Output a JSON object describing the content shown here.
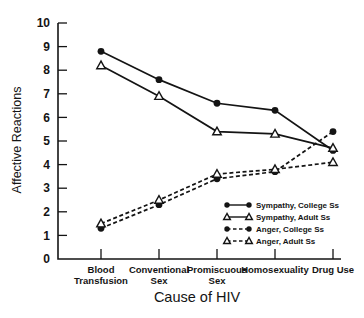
{
  "chart_data": {
    "type": "line",
    "title": "",
    "xlabel": "Cause of HIV",
    "ylabel": "Affective Reactions",
    "ylim": [
      0,
      10
    ],
    "y_ticks": [
      0,
      1,
      2,
      3,
      4,
      5,
      6,
      7,
      8,
      9,
      10
    ],
    "grid": false,
    "legend_position": "inside-bottom-right",
    "categories": [
      "Blood Transfusion",
      "Conventional Sex",
      "Promiscuous Sex",
      "Homosexuality",
      "Drug Use"
    ],
    "category_label_lines": [
      [
        "Blood",
        "Transfusion"
      ],
      [
        "Conventional",
        "Sex"
      ],
      [
        "Promiscuous",
        "Sex"
      ],
      [
        "Homosexuality"
      ],
      [
        "Drug Use"
      ]
    ],
    "series": [
      {
        "name": "Sympathy, College Ss",
        "line": "solid",
        "marker": "filled-circle",
        "values": [
          8.8,
          7.6,
          6.6,
          6.3,
          4.6
        ]
      },
      {
        "name": "Sympathy, Adult Ss",
        "line": "solid",
        "marker": "open-triangle",
        "values": [
          8.2,
          6.9,
          5.4,
          5.3,
          4.7
        ]
      },
      {
        "name": "Anger, College Ss",
        "line": "dashed",
        "marker": "filled-circle",
        "values": [
          1.3,
          2.3,
          3.4,
          3.7,
          5.4
        ]
      },
      {
        "name": "Anger, Adult Ss",
        "line": "dashed",
        "marker": "open-triangle",
        "values": [
          1.5,
          2.5,
          3.6,
          3.8,
          4.1
        ]
      }
    ],
    "colors": {
      "ink": "#141414",
      "background": "#ffffff"
    }
  }
}
